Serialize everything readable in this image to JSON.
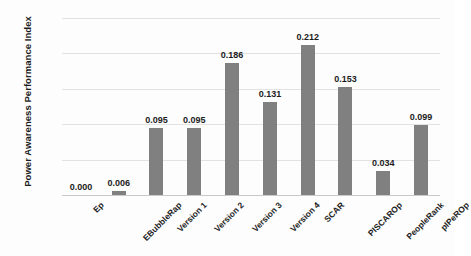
{
  "chart_data": {
    "type": "bar",
    "title": "",
    "xlabel": "",
    "ylabel": "Power Awareness Performance Index",
    "ylim": [
      0,
      0.25
    ],
    "yticks": [
      "0",
      "0.05",
      "0.1",
      "0.15",
      "0.2",
      "0.25"
    ],
    "ytick_values": [
      0,
      0.05,
      0.1,
      0.15,
      0.2,
      0.25
    ],
    "grid": true,
    "legend": "none",
    "bar_color": "#808080",
    "categories": [
      "Ep",
      "EBubbleRap",
      "Version 1",
      "Version 2",
      "Version 3",
      "Version 4",
      "SCAR",
      "PISCAROp",
      "PeopleRank",
      "pIPeROp"
    ],
    "values": [
      0.0,
      0.006,
      0.095,
      0.095,
      0.186,
      0.131,
      0.212,
      0.153,
      0.034,
      0.099
    ],
    "data_labels": [
      "0.000",
      "0.006",
      "0.095",
      "0.095",
      "0.186",
      "0.131",
      "0.212",
      "0.153",
      "0.034",
      "0.099"
    ]
  }
}
